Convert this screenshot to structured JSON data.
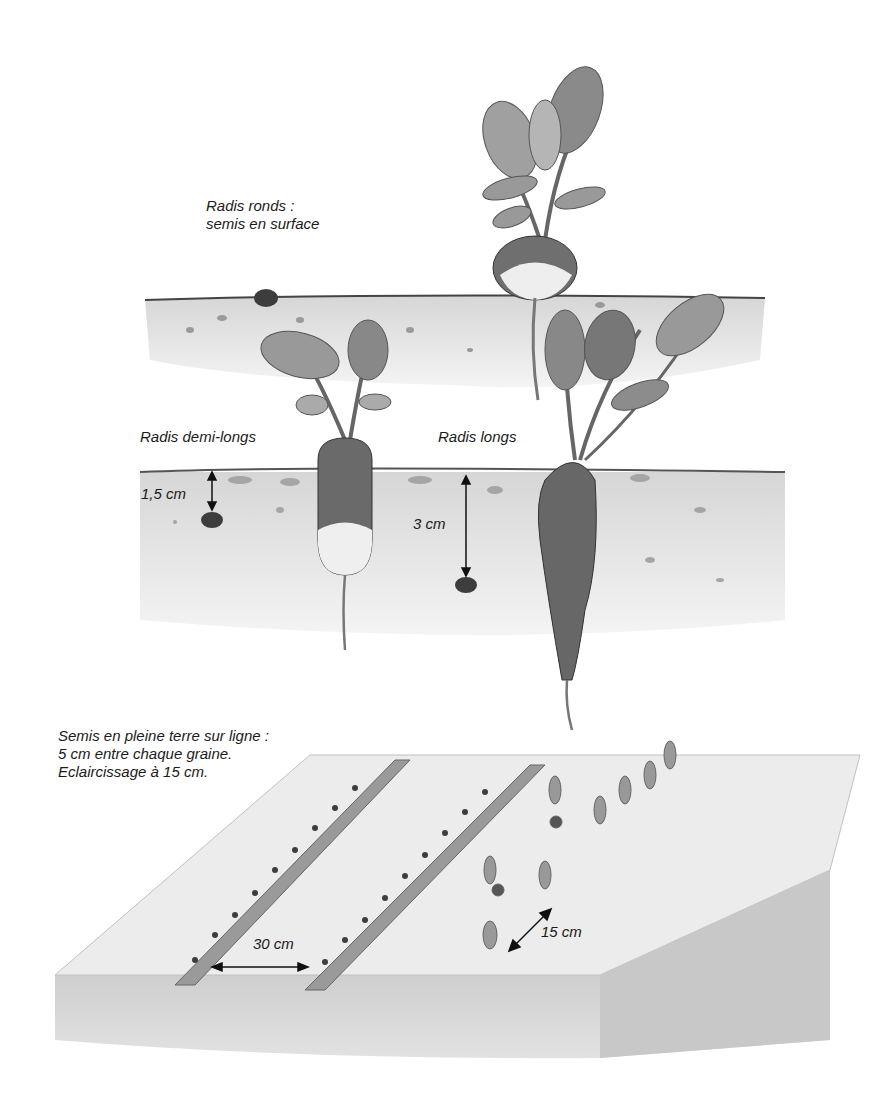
{
  "figure": {
    "panels": [
      {
        "id": "depth-panel",
        "labels": {
          "round": [
            "Radis ronds :",
            "semis en surface"
          ],
          "half_long": "Radis demi-longs",
          "long": "Radis longs",
          "depth_half_long": "1,5 cm",
          "depth_long": "3 cm"
        }
      },
      {
        "id": "row-panel",
        "labels": {
          "caption": [
            "Semis en pleine terre sur ligne :",
            "5 cm entre chaque graine.",
            "Eclaircissage à 15 cm."
          ],
          "row_spacing": "30 cm",
          "thinning_spacing": "15 cm"
        }
      }
    ],
    "colors": {
      "soil": "#d9d9d9",
      "soil_dark": "#a8a8a8",
      "radish": "#6e6e6e",
      "leaf": "#8c8c8c",
      "ink": "#1a1a1a"
    }
  }
}
